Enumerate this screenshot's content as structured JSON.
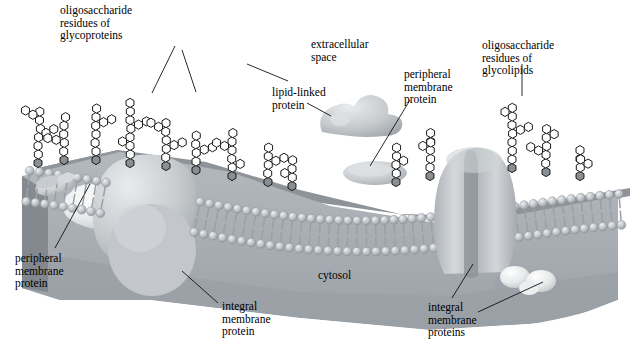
{
  "figure": {
    "background_color": "#ffffff",
    "width": 639,
    "height": 350
  },
  "labels": [
    {
      "id": "oligosaccharide-glycoproteins",
      "lines": [
        "oligosaccharide",
        "residues of",
        "glycoproteins"
      ],
      "x": 60,
      "y": 4
    },
    {
      "id": "extracellular-space",
      "lines": [
        "extracellular",
        "space"
      ],
      "x": 311,
      "y": 38
    },
    {
      "id": "lipid-linked-protein",
      "lines": [
        "lipid-linked",
        "protein"
      ],
      "x": 272,
      "y": 86
    },
    {
      "id": "peripheral-membrane-protein-top",
      "lines": [
        "peripheral",
        "membrane",
        "protein"
      ],
      "x": 404,
      "y": 68
    },
    {
      "id": "oligosaccharide-glycolipids",
      "lines": [
        "oligosaccharide",
        "residues of",
        "glycolipids"
      ],
      "x": 482,
      "y": 39
    },
    {
      "id": "peripheral-membrane-protein-left",
      "lines": [
        "peripheral",
        "membrane",
        "protein"
      ],
      "x": 15,
      "y": 252
    },
    {
      "id": "cytosol",
      "lines": [
        "cytosol"
      ],
      "x": 318,
      "y": 269
    },
    {
      "id": "integral-membrane-protein",
      "lines": [
        "integral",
        "membrane",
        "protein"
      ],
      "x": 222,
      "y": 300
    },
    {
      "id": "integral-membrane-proteins",
      "lines": [
        "integral",
        "membrane",
        "proteins"
      ],
      "x": 428,
      "y": 301
    }
  ],
  "leaders": [
    {
      "id": "leader-glycoprotein-a",
      "points": "175,46 152,93"
    },
    {
      "id": "leader-glycoprotein-b",
      "points": "182,50 196,92"
    },
    {
      "id": "leader-glycoprotein-c",
      "points": "247,64 288,81"
    },
    {
      "id": "leader-lipid-linked",
      "points": "307,103 331,116"
    },
    {
      "id": "leader-peripheral-top",
      "points": "410,100 370,166"
    },
    {
      "id": "leader-glycolipid",
      "points": "522,64 522,96"
    },
    {
      "id": "leader-peripheral-left",
      "points": "90,184 55,248"
    },
    {
      "id": "leader-integral-left",
      "points": "218,303 182,271"
    },
    {
      "id": "leader-integral-right-a",
      "points": "452,298 473,264"
    },
    {
      "id": "leader-integral-right-b",
      "points": "478,312 543,282"
    }
  ],
  "structures": {
    "membrane": {
      "name": "phospholipid-bilayer",
      "head_color": "#b6bcc2",
      "tail_color": "#9aa0a6",
      "description": "curved lipid bilayer with spherical head groups and paired hydrocarbon tails"
    },
    "cytosol_slab": {
      "name": "cytosol-region",
      "top_color": "#8e949a",
      "front_color": "#a9afb5"
    },
    "proteins": [
      {
        "id": "peripheral-left",
        "kind": "peripheral",
        "color": "#e4e6e8"
      },
      {
        "id": "integral-left",
        "kind": "integral",
        "color": "#c6cacd"
      },
      {
        "id": "lipid-linked",
        "kind": "lipid-linked",
        "color": "#c4c8cb"
      },
      {
        "id": "peripheral-top",
        "kind": "peripheral",
        "color": "#c9cdd0"
      },
      {
        "id": "channel",
        "kind": "integral-channel",
        "color": "#c0c4c8"
      },
      {
        "id": "integral-cytosolic",
        "kind": "integral",
        "color": "#c9cdd1"
      }
    ],
    "sugars": {
      "name": "oligosaccharide-chain",
      "ring_fill": "#ffffff",
      "ring_stroke": "#1a1a1a",
      "anchor_fill": "#8a8f94"
    }
  }
}
